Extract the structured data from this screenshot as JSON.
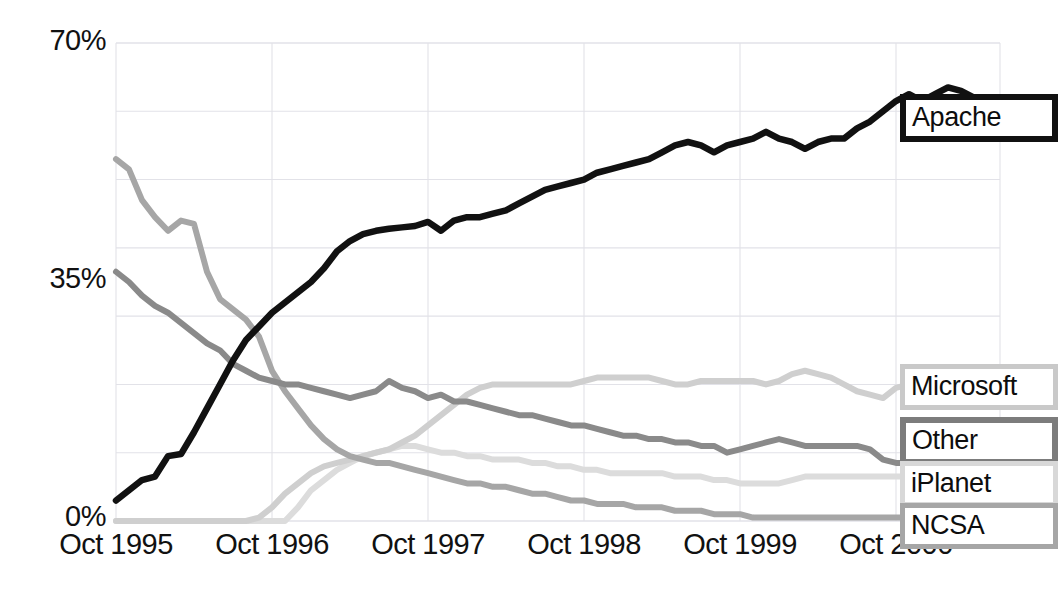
{
  "chart_data": {
    "type": "line",
    "title": "",
    "subtitle": "",
    "xlabel": "",
    "ylabel": "",
    "grid": true,
    "legend_position": "right-inline-callouts",
    "ylim": [
      0,
      70
    ],
    "yticks": [
      0,
      35,
      70
    ],
    "ytick_labels": [
      "0%",
      "35%",
      "70%"
    ],
    "y_gridlines": [
      0,
      10,
      20,
      30,
      40,
      50,
      60,
      70
    ],
    "xlim": [
      "Oct 1995",
      "Apr 2001"
    ],
    "xticks": [
      "Oct 1995",
      "Oct 1996",
      "Oct 1997",
      "Oct 1998",
      "Oct 1999",
      "Oct 2000"
    ],
    "x_unit": "month",
    "series": [
      {
        "name": "Apache",
        "color": "#111111",
        "values": [
          3.0,
          4.5,
          6.0,
          6.5,
          9.5,
          9.8,
          13.0,
          16.5,
          20.0,
          23.5,
          26.5,
          28.5,
          30.5,
          32.0,
          33.5,
          35.0,
          37.0,
          39.5,
          41.0,
          42.0,
          42.5,
          42.8,
          43.0,
          43.2,
          43.8,
          42.5,
          44.0,
          44.5,
          44.5,
          45.0,
          45.5,
          46.5,
          47.5,
          48.5,
          49.0,
          49.5,
          50.0,
          51.0,
          51.5,
          52.0,
          52.5,
          53.0,
          54.0,
          55.0,
          55.5,
          55.0,
          54.0,
          55.0,
          55.5,
          56.0,
          57.0,
          56.0,
          55.5,
          54.5,
          55.5,
          56.0,
          56.0,
          57.5,
          58.5,
          60.0,
          61.5,
          62.5,
          61.5,
          62.5,
          63.5,
          63.0,
          62.0,
          61.0
        ]
      },
      {
        "name": "Microsoft",
        "color": "#cfcfcf",
        "values": [
          0.0,
          0.0,
          0.0,
          0.0,
          0.0,
          0.0,
          0.0,
          0.0,
          0.0,
          0.0,
          0.0,
          0.5,
          2.0,
          4.0,
          5.5,
          7.0,
          8.0,
          8.5,
          9.0,
          9.5,
          10.0,
          10.5,
          11.5,
          12.5,
          14.0,
          15.5,
          17.0,
          18.5,
          19.5,
          20.0,
          20.0,
          20.0,
          20.0,
          20.0,
          20.0,
          20.0,
          20.5,
          21.0,
          21.0,
          21.0,
          21.0,
          21.0,
          20.5,
          20.0,
          20.0,
          20.5,
          20.5,
          20.5,
          20.5,
          20.5,
          20.0,
          20.5,
          21.5,
          22.0,
          21.5,
          21.0,
          20.0,
          19.0,
          18.5,
          18.0,
          19.5,
          20.0,
          19.0,
          18.5,
          18.0,
          18.0,
          18.0,
          18.0
        ]
      },
      {
        "name": "Other",
        "color": "#8a8a8a",
        "values": [
          36.5,
          35.0,
          33.0,
          31.5,
          30.5,
          29.0,
          27.5,
          26.0,
          25.0,
          23.0,
          22.0,
          21.0,
          20.5,
          20.0,
          20.0,
          19.5,
          19.0,
          18.5,
          18.0,
          18.5,
          19.0,
          20.5,
          19.5,
          19.0,
          18.0,
          18.5,
          17.5,
          17.5,
          17.0,
          16.5,
          16.0,
          15.5,
          15.5,
          15.0,
          14.5,
          14.0,
          14.0,
          13.5,
          13.0,
          12.5,
          12.5,
          12.0,
          12.0,
          11.5,
          11.5,
          11.0,
          11.0,
          10.0,
          10.5,
          11.0,
          11.5,
          12.0,
          11.5,
          11.0,
          11.0,
          11.0,
          11.0,
          11.0,
          10.5,
          9.0,
          8.5,
          8.5,
          7.0,
          7.5,
          6.5,
          7.0,
          9.0,
          11.0
        ]
      },
      {
        "name": "iPlanet",
        "color": "#dcdcdc",
        "values": [
          0.0,
          0.0,
          0.0,
          0.0,
          0.0,
          0.0,
          0.0,
          0.0,
          0.0,
          0.0,
          0.0,
          0.0,
          0.0,
          0.0,
          2.0,
          4.5,
          6.0,
          7.5,
          8.5,
          9.5,
          10.0,
          10.5,
          11.0,
          11.0,
          10.5,
          10.0,
          10.0,
          9.5,
          9.5,
          9.0,
          9.0,
          9.0,
          8.5,
          8.5,
          8.0,
          8.0,
          7.5,
          7.5,
          7.0,
          7.0,
          7.0,
          7.0,
          7.0,
          6.5,
          6.5,
          6.5,
          6.0,
          6.0,
          5.5,
          5.5,
          5.5,
          5.5,
          6.0,
          6.5,
          6.5,
          6.5,
          6.5,
          6.5,
          6.5,
          6.5,
          6.5,
          6.5,
          6.5,
          6.5,
          6.5,
          6.5,
          6.5,
          6.5
        ]
      },
      {
        "name": "NCSA",
        "color": "#a6a6a6",
        "values": [
          53.0,
          51.5,
          47.0,
          44.5,
          42.5,
          44.0,
          43.5,
          36.5,
          32.5,
          31.0,
          29.5,
          27.0,
          22.0,
          19.0,
          16.5,
          14.0,
          12.0,
          10.5,
          9.5,
          9.0,
          8.5,
          8.5,
          8.0,
          7.5,
          7.0,
          6.5,
          6.0,
          5.5,
          5.5,
          5.0,
          5.0,
          4.5,
          4.0,
          4.0,
          3.5,
          3.0,
          3.0,
          2.5,
          2.5,
          2.5,
          2.0,
          2.0,
          2.0,
          1.5,
          1.5,
          1.5,
          1.0,
          1.0,
          1.0,
          0.5,
          0.5,
          0.5,
          0.5,
          0.5,
          0.5,
          0.5,
          0.5,
          0.5,
          0.5,
          0.5,
          0.5,
          0.5,
          0.5,
          0.5,
          0.5,
          0.5,
          0.5,
          0.5
        ]
      }
    ]
  },
  "axes": {
    "ytick_labels": {
      "top": "70%",
      "mid": "35%",
      "bottom": "0%"
    },
    "xtick_labels": [
      "Oct 1995",
      "Oct 1996",
      "Oct 1997",
      "Oct 1998",
      "Oct 1999",
      "Oct 2000"
    ]
  },
  "legend": {
    "apache": "Apache",
    "microsoft": "Microsoft",
    "other": "Other",
    "iplanet": "iPlanet",
    "ncsa": "NCSA"
  },
  "colors": {
    "apache": "#111111",
    "microsoft": "#cfcfcf",
    "other": "#8a8a8a",
    "iplanet": "#dcdcdc",
    "ncsa": "#a6a6a6",
    "grid": "#e2e2e8",
    "text": "#111111",
    "background": "#ffffff"
  }
}
